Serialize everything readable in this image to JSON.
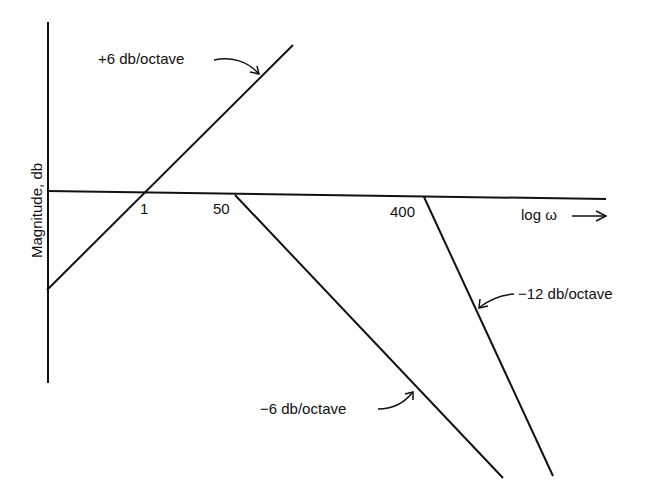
{
  "diagram": {
    "type": "bode-magnitude-asymptotes",
    "y_axis_label": "Magnitude, db",
    "x_axis_label": "log ω →",
    "tick_labels": [
      "1",
      "50",
      "400"
    ],
    "annotations": [
      {
        "text": "+6 db/octave",
        "target": "rising line through ω=1"
      },
      {
        "text": "−12 db/octave",
        "target": "line starting at ω=400"
      },
      {
        "text": "−6 db/octave",
        "target": "line starting at ω=50"
      }
    ]
  },
  "labels": {
    "ylabel": "Magnitude, db",
    "xlabel": "log ω",
    "t1": "1",
    "t50": "50",
    "t400": "400",
    "plus6": "+6 db/octave",
    "minus12": "−12 db/octave",
    "minus6": "−6 db/octave"
  }
}
